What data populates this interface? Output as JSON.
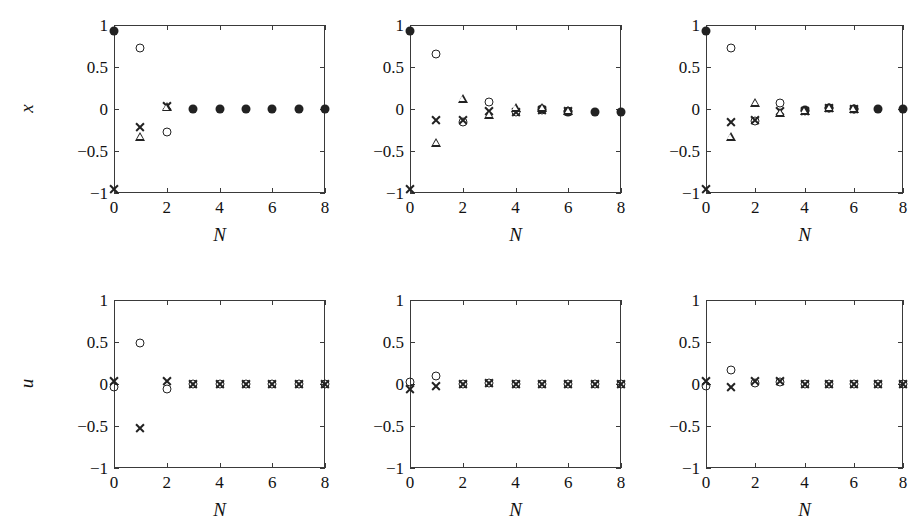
{
  "figure": {
    "rows": 2,
    "cols": 3,
    "background": "#ffffff",
    "marker_color": "#222222",
    "axis_color": "#3a3a3a"
  },
  "axis": {
    "xlabel": "N",
    "ylabel_top": "x",
    "ylabel_bottom": "u",
    "xticks": [
      "0",
      "2",
      "4",
      "6",
      "8"
    ],
    "xtick_values": [
      0,
      2,
      4,
      6,
      8
    ],
    "yticks": [
      "1",
      "0.5",
      "0",
      "−0.5",
      "−1"
    ],
    "ytick_values": [
      1,
      0.5,
      0,
      -0.5,
      -1
    ],
    "xlim": [
      0,
      8
    ],
    "ylim": [
      -1,
      1
    ]
  },
  "series_names": [
    "filled-circle",
    "open-circle",
    "cross",
    "triangle"
  ],
  "chart_data": [
    {
      "type": "scatter",
      "panel": "top-left",
      "row": 0,
      "col": 0,
      "title": "",
      "xlabel": "N",
      "ylabel": "x",
      "xlim": [
        0,
        8
      ],
      "ylim": [
        -1,
        1
      ],
      "grid": false,
      "legend": "none",
      "x": [
        0,
        1,
        2,
        3,
        4,
        5,
        6,
        7,
        8
      ],
      "series": [
        {
          "name": "filled-circle",
          "marker": "filled-circle",
          "values": [
            0.93,
            null,
            null,
            0.0,
            0.0,
            0.0,
            0.0,
            0.0,
            0.0
          ]
        },
        {
          "name": "open-circle",
          "marker": "open-circle",
          "values": [
            null,
            0.73,
            -0.27,
            null,
            null,
            null,
            null,
            null,
            null
          ]
        },
        {
          "name": "cross",
          "marker": "cross",
          "values": [
            -0.95,
            -0.22,
            0.04,
            null,
            null,
            null,
            null,
            null,
            null
          ]
        },
        {
          "name": "triangle",
          "marker": "triangle",
          "values": [
            null,
            -0.33,
            0.02,
            null,
            null,
            null,
            null,
            null,
            null
          ]
        }
      ]
    },
    {
      "type": "scatter",
      "panel": "top-center",
      "row": 0,
      "col": 1,
      "title": "",
      "xlabel": "N",
      "ylabel": "x",
      "xlim": [
        0,
        8
      ],
      "ylim": [
        -1,
        1
      ],
      "grid": false,
      "legend": "none",
      "x": [
        0,
        1,
        2,
        3,
        4,
        5,
        6,
        7,
        8
      ],
      "series": [
        {
          "name": "filled-circle",
          "marker": "filled-circle",
          "values": [
            0.93,
            null,
            null,
            null,
            null,
            0.0,
            -0.03,
            -0.03,
            -0.03
          ]
        },
        {
          "name": "open-circle",
          "marker": "open-circle",
          "values": [
            null,
            0.66,
            -0.15,
            0.08,
            -0.04,
            -0.01,
            -0.02,
            null,
            null
          ]
        },
        {
          "name": "cross",
          "marker": "cross",
          "values": [
            -0.95,
            -0.13,
            -0.13,
            -0.02,
            -0.03,
            -0.01,
            -0.02,
            null,
            null
          ]
        },
        {
          "name": "triangle",
          "marker": "triangle",
          "values": [
            null,
            -0.4,
            0.12,
            -0.07,
            0.01,
            0.01,
            -0.02,
            null,
            null
          ]
        }
      ]
    },
    {
      "type": "scatter",
      "panel": "top-right",
      "row": 0,
      "col": 2,
      "title": "",
      "xlabel": "N",
      "ylabel": "x",
      "xlim": [
        0,
        8
      ],
      "ylim": [
        -1,
        1
      ],
      "grid": false,
      "legend": "none",
      "x": [
        0,
        1,
        2,
        3,
        4,
        5,
        6,
        7,
        8
      ],
      "series": [
        {
          "name": "filled-circle",
          "marker": "filled-circle",
          "values": [
            0.93,
            null,
            null,
            null,
            -0.01,
            0.01,
            0.0,
            0.0,
            0.0
          ]
        },
        {
          "name": "open-circle",
          "marker": "open-circle",
          "values": [
            null,
            0.73,
            -0.14,
            0.07,
            -0.02,
            0.01,
            0.0,
            null,
            null
          ]
        },
        {
          "name": "cross",
          "marker": "cross",
          "values": [
            -0.95,
            -0.15,
            -0.13,
            -0.02,
            -0.02,
            0.01,
            0.0,
            null,
            null
          ]
        },
        {
          "name": "triangle",
          "marker": "triangle",
          "values": [
            null,
            -0.33,
            0.07,
            -0.05,
            -0.02,
            0.01,
            0.0,
            null,
            null
          ]
        }
      ]
    },
    {
      "type": "scatter",
      "panel": "bottom-left",
      "row": 1,
      "col": 0,
      "title": "",
      "xlabel": "N",
      "ylabel": "u",
      "xlim": [
        0,
        8
      ],
      "ylim": [
        -1,
        1
      ],
      "grid": false,
      "legend": "none",
      "x": [
        0,
        1,
        2,
        3,
        4,
        5,
        6,
        7,
        8
      ],
      "series": [
        {
          "name": "open-circle",
          "marker": "open-circle",
          "values": [
            -0.03,
            0.49,
            -0.06,
            0.0,
            0.0,
            0.0,
            0.0,
            0.0,
            0.0
          ]
        },
        {
          "name": "cross",
          "marker": "cross",
          "values": [
            0.03,
            -0.52,
            0.04,
            0.0,
            0.0,
            0.0,
            0.0,
            0.0,
            0.0
          ]
        }
      ]
    },
    {
      "type": "scatter",
      "panel": "bottom-center",
      "row": 1,
      "col": 1,
      "title": "",
      "xlabel": "N",
      "ylabel": "u",
      "xlim": [
        0,
        8
      ],
      "ylim": [
        -1,
        1
      ],
      "grid": false,
      "legend": "none",
      "x": [
        0,
        1,
        2,
        3,
        4,
        5,
        6,
        7,
        8
      ],
      "series": [
        {
          "name": "open-circle",
          "marker": "open-circle",
          "values": [
            0.02,
            0.09,
            0.0,
            0.01,
            0.0,
            0.0,
            0.0,
            0.0,
            0.0
          ]
        },
        {
          "name": "cross",
          "marker": "cross",
          "values": [
            -0.06,
            -0.02,
            0.0,
            0.01,
            0.0,
            0.0,
            0.0,
            0.0,
            0.0
          ]
        }
      ]
    },
    {
      "type": "scatter",
      "panel": "bottom-right",
      "row": 1,
      "col": 2,
      "title": "",
      "xlabel": "N",
      "ylabel": "u",
      "xlim": [
        0,
        8
      ],
      "ylim": [
        -1,
        1
      ],
      "grid": false,
      "legend": "none",
      "x": [
        0,
        1,
        2,
        3,
        4,
        5,
        6,
        7,
        8
      ],
      "series": [
        {
          "name": "open-circle",
          "marker": "open-circle",
          "values": [
            -0.02,
            0.17,
            0.01,
            0.02,
            0.0,
            0.0,
            0.0,
            0.0,
            0.0
          ]
        },
        {
          "name": "cross",
          "marker": "cross",
          "values": [
            0.04,
            -0.03,
            0.03,
            0.03,
            0.0,
            0.0,
            0.0,
            0.0,
            0.0
          ]
        }
      ]
    }
  ]
}
